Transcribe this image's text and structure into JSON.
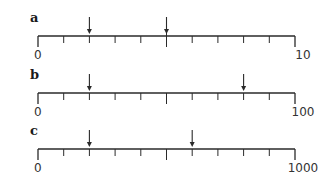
{
  "diagram": {
    "type": "number-lines",
    "color": "#2a2a2a",
    "lines": [
      {
        "label": "a",
        "start": "0",
        "end": "10",
        "divisions": 10,
        "arrows_at_ticks": [
          2,
          5
        ],
        "y": 36
      },
      {
        "label": "b",
        "start": "0",
        "end": "100",
        "divisions": 10,
        "arrows_at_ticks": [
          2,
          8
        ],
        "y": 93
      },
      {
        "label": "c",
        "start": "0",
        "end": "1000",
        "divisions": 10,
        "arrows_at_ticks": [
          2,
          6
        ],
        "y": 149
      }
    ]
  }
}
